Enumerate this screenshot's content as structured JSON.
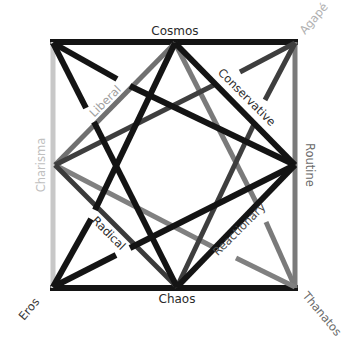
{
  "diagram": {
    "type": "star-square",
    "colors": {
      "black": "#141414",
      "dark_gray": "#3e3e3e",
      "mid_gray": "#6e6e6e",
      "light_gray": "#c8c8c8",
      "label_dark": "#2a2a2a",
      "label_light": "#bdbdbd"
    },
    "nodes": {
      "top_left": "",
      "top_middle": "Cosmos",
      "top_right": "Agapé",
      "middle_left": "Charisma",
      "middle_right": "Routine",
      "bottom_left": "Eros",
      "bottom_middle": "Chaos",
      "bottom_right": "Thanatos"
    },
    "line_labels": {
      "liberal": "Liberal",
      "conservative": "Conservative",
      "radical": "Radical",
      "reactionary": "Reactionary"
    }
  }
}
